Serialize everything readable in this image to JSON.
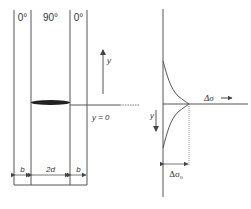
{
  "diagram": {
    "laminate": {
      "plies": [
        {
          "label": "0°",
          "width_label": "b"
        },
        {
          "label": "90°",
          "width_label": "2d"
        },
        {
          "label": "0°",
          "width_label": "b"
        }
      ],
      "crack": "transverse-crack-ellipse",
      "axis_label": "y",
      "origin_label": "y = 0"
    },
    "stress_plot": {
      "x_axis_label": "Δσ",
      "x_axis_arrow": "→",
      "y_axis_label": "y",
      "peak_label": "Δσ",
      "peak_subscript": "o"
    },
    "colors": {
      "line": "#555555",
      "text": "#333333",
      "crack": "#222222",
      "background": "#ffffff"
    }
  }
}
